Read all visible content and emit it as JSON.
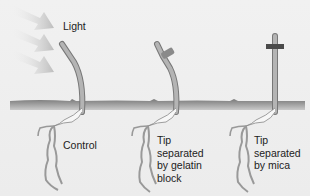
{
  "light_label": "Light",
  "seedlings": [
    {
      "id": "control",
      "label_lines": [
        "Control"
      ]
    },
    {
      "id": "gelatin",
      "label_lines": [
        "Tip",
        "separated",
        "by gelatin",
        "block"
      ]
    },
    {
      "id": "mica",
      "label_lines": [
        "Tip",
        "separated",
        "by mica"
      ]
    }
  ],
  "colors": {
    "background": "#eeeeee",
    "soil": "#8c8c8c",
    "stem": "#a9a9a9",
    "gelatin_block": "#8a8a8a",
    "mica_plate": "#4a4a4a",
    "light_arrow": "#c8c8c8"
  }
}
